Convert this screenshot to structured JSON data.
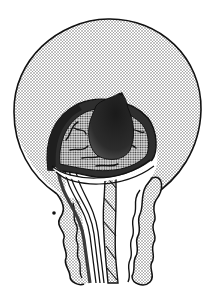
{
  "figure": {
    "type": "anatomical-illustration",
    "colors": {
      "background": "#ffffff",
      "outline": "#111111",
      "stipple_light": "#d4d4d4",
      "stipple_mid": "#a8a8a8",
      "dark_mass": "#2a2a2a",
      "dark_band": "#3a3a3a"
    },
    "parts": [
      {
        "name": "outer-sac"
      },
      {
        "name": "dark-mass"
      },
      {
        "name": "textured-dome"
      },
      {
        "name": "left-tubes"
      },
      {
        "name": "center-twisted-cord"
      },
      {
        "name": "left-wavy-wall"
      },
      {
        "name": "right-wavy-wall"
      }
    ],
    "caption": ""
  }
}
